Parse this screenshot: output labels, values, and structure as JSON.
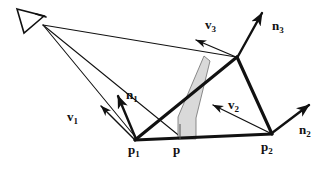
{
  "figure": {
    "background_color": "#ffffff",
    "stroke_color": "#111111",
    "sliver_fill_color": "#d9d9d9",
    "width": 328,
    "height": 173
  },
  "labels": {
    "v1": {
      "base": "v",
      "sub": "1",
      "x": 67,
      "y": 118
    },
    "v2": {
      "base": "v",
      "sub": "2",
      "x": 228,
      "y": 106
    },
    "v3": {
      "base": "v",
      "sub": "3",
      "x": 205,
      "y": 25
    },
    "n1": {
      "base": "n",
      "sub": "1",
      "x": 126,
      "y": 96
    },
    "n2": {
      "base": "n",
      "sub": "2",
      "x": 300,
      "y": 131
    },
    "n3": {
      "base": "n",
      "sub": "3",
      "x": 272,
      "y": 27
    },
    "p1": {
      "base": "p",
      "sub": "1",
      "x": 128,
      "y": 150
    },
    "p2": {
      "base": "p",
      "sub": "2",
      "x": 262,
      "y": 147
    },
    "p": {
      "base": "p",
      "sub": "",
      "x": 173,
      "y": 150
    }
  },
  "geometry": {
    "eye": {
      "x": 42,
      "y": 25,
      "name": "viewpoint-eye"
    },
    "p1": {
      "x": 135,
      "y": 140
    },
    "p2": {
      "x": 272,
      "y": 134
    },
    "p3": {
      "x": 237,
      "y": 57
    },
    "p": {
      "x": 180,
      "y": 139
    },
    "eye_symbol": "eye-triangle-glyph",
    "triangle_edges": [
      "p1-p3",
      "p3-p2",
      "p2-p1"
    ],
    "rays": [
      "eye-to-p1",
      "eye-to-p",
      "eye-to-p3"
    ],
    "normals": [
      "n1-at-p1",
      "n2-at-p2",
      "n3-at-p3"
    ],
    "view_vectors": [
      "v1-at-p1",
      "v2-at-p2",
      "v3-at-p3"
    ],
    "sliver_polygon": "thin-shaded-quadrilateral"
  }
}
